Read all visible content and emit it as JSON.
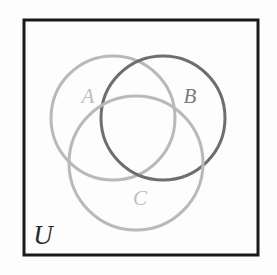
{
  "figure": {
    "name": "three-set-venn-diagram",
    "background_color": "#fdfdfd"
  },
  "universe": {
    "label": "U",
    "border_color": "#1a1a1a",
    "label_color": "#2b2b2b",
    "x": 24,
    "y": 20,
    "width": 234,
    "height": 235,
    "border_width": 3,
    "label_x": 43,
    "label_y": 238,
    "label_size": 27
  },
  "sets": [
    {
      "id": "set-a",
      "label": "A",
      "color": "#b9b9b9",
      "label_color": "#bdbdbd",
      "cx": 113,
      "cy": 118,
      "r": 62,
      "stroke_width": 3,
      "label_x": 88,
      "label_y": 98,
      "label_size": 21
    },
    {
      "id": "set-b",
      "label": "B",
      "color": "#6e6e6e",
      "label_color": "#7a7a7a",
      "cx": 163,
      "cy": 118,
      "r": 62,
      "stroke_width": 3,
      "label_x": 190,
      "label_y": 98,
      "label_size": 21
    },
    {
      "id": "set-c",
      "label": "C",
      "color": "#b9b9b9",
      "label_color": "#bdbdbd",
      "cx": 136,
      "cy": 163,
      "r": 67,
      "stroke_width": 3,
      "label_x": 140,
      "label_y": 200,
      "label_size": 21
    }
  ]
}
